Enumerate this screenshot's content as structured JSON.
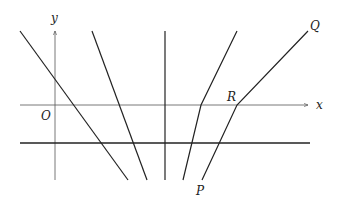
{
  "diagram": {
    "type": "coordinate-plane-lines",
    "axes": {
      "x_label": "x",
      "y_label": "y",
      "origin_label": "O"
    },
    "points": {
      "P": "P",
      "Q": "Q",
      "R": "R"
    },
    "elements": [
      {
        "id": "x-axis",
        "kind": "axis",
        "from": [
          20,
          105
        ],
        "to": [
          308,
          105
        ]
      },
      {
        "id": "y-axis",
        "kind": "axis",
        "from": [
          55,
          180
        ],
        "to": [
          55,
          31
        ]
      },
      {
        "id": "horizontal-line",
        "kind": "line",
        "from": [
          20,
          143
        ],
        "to": [
          310,
          143
        ]
      },
      {
        "id": "line-1",
        "kind": "line",
        "from": [
          20,
          31
        ],
        "to": [
          128,
          180
        ]
      },
      {
        "id": "line-2",
        "kind": "line",
        "from": [
          92,
          31
        ],
        "to": [
          147,
          180
        ]
      },
      {
        "id": "vertical-line",
        "kind": "line",
        "from": [
          165,
          31
        ],
        "to": [
          165,
          180
        ]
      },
      {
        "id": "broken-line-1",
        "kind": "polyline",
        "points": [
          [
            237,
            31
          ],
          [
            201,
            105
          ],
          [
            183,
            180
          ]
        ]
      },
      {
        "id": "broken-line-PRQ",
        "kind": "polyline",
        "points": [
          [
            308,
            31
          ],
          [
            237,
            105
          ],
          [
            202,
            180
          ]
        ]
      }
    ],
    "colors": {
      "stroke": "#222222",
      "axis": "#555555"
    }
  }
}
